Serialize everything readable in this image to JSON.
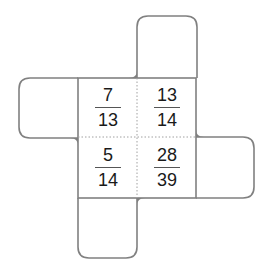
{
  "diagram": {
    "type": "cube-net",
    "colors": {
      "stroke": "#808080",
      "divider": "#a0a0a0",
      "text": "#1a1a1a"
    },
    "center_cells": [
      {
        "position": "top-left",
        "numerator": "7",
        "denominator": "13"
      },
      {
        "position": "top-right",
        "numerator": "13",
        "denominator": "14"
      },
      {
        "position": "bottom-left",
        "numerator": "5",
        "denominator": "14"
      },
      {
        "position": "bottom-right",
        "numerator": "28",
        "denominator": "39"
      }
    ],
    "flaps": [
      "top",
      "left",
      "right",
      "bottom"
    ]
  }
}
